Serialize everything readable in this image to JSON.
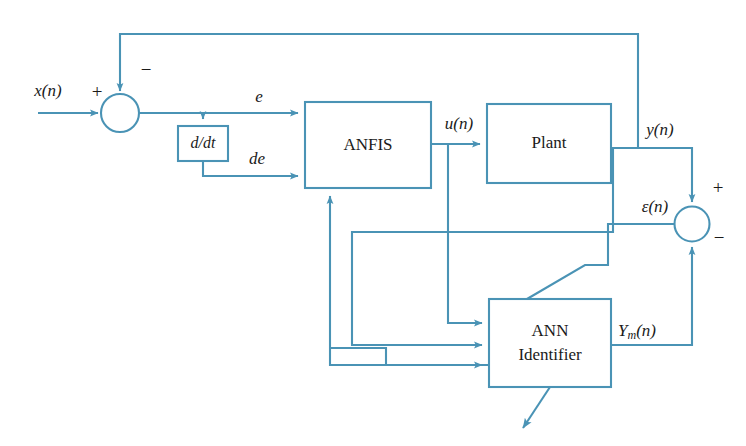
{
  "diagram": {
    "stroke_color": "#4a93b5",
    "text_color": "#1a1a1a",
    "background_color": "#ffffff",
    "blocks": [
      {
        "id": "anfis",
        "label": "ANFIS"
      },
      {
        "id": "plant",
        "label": "Plant"
      },
      {
        "id": "ann",
        "label_line1": "ANN",
        "label_line2": "Identifier"
      },
      {
        "id": "ddt",
        "label": "d/dt"
      }
    ],
    "junctions": [
      {
        "id": "sum-error",
        "inputs": [
          "+",
          "-"
        ]
      },
      {
        "id": "sum-epsilon",
        "inputs": [
          "+",
          "-"
        ]
      }
    ],
    "signals": {
      "reference": "x(n)",
      "error": "e",
      "error_derivative": "de",
      "control": "u(n)",
      "plant_output": "y(n)",
      "model_output_main": "Y",
      "model_output_sub": "m",
      "model_output_tail": "(n)",
      "identification_error_main": "ε(n)"
    },
    "signs": {
      "sum_error_plus": "+",
      "sum_error_minus": "−",
      "sum_epsilon_plus": "+",
      "sum_epsilon_minus": "−"
    }
  }
}
